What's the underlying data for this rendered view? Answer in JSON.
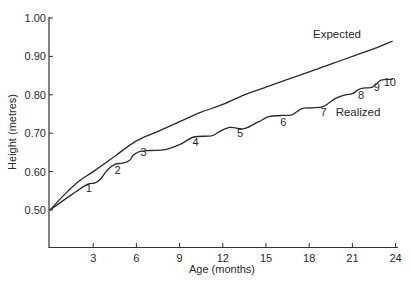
{
  "chart_data": {
    "type": "line",
    "title": "",
    "xlabel": "Age (months)",
    "ylabel": "Height (metres)",
    "xlim": [
      0,
      24
    ],
    "ylim": [
      0.42,
      1.0
    ],
    "grid": false,
    "legend": "inline labels",
    "x_ticks": [
      3,
      6,
      9,
      12,
      15,
      18,
      21,
      24
    ],
    "x_tick_labels": [
      "3",
      "6",
      "9",
      "12",
      "15",
      "18",
      "21",
      "24"
    ],
    "y_ticks": [
      0.5,
      0.6,
      0.7,
      0.8,
      0.9,
      1.0
    ],
    "y_tick_labels": [
      "0.50",
      "0.60",
      "0.70",
      "0.80",
      "0.90",
      "1.00"
    ],
    "series": [
      {
        "name": "Expected",
        "label": "Expected",
        "x": [
          0,
          1,
          2,
          3,
          4.5,
          6,
          7.5,
          9,
          10.5,
          12,
          13.5,
          15,
          16.5,
          18,
          19.5,
          21,
          22.5,
          23.8
        ],
        "values": [
          0.5,
          0.54,
          0.575,
          0.6,
          0.64,
          0.68,
          0.705,
          0.73,
          0.755,
          0.775,
          0.8,
          0.82,
          0.84,
          0.86,
          0.88,
          0.9,
          0.92,
          0.94
        ]
      },
      {
        "name": "Realized",
        "label": "Realized",
        "x": [
          0,
          1.5,
          2.6,
          3.1,
          3.5,
          4.0,
          4.5,
          5.0,
          5.5,
          5.8,
          6.2,
          7.0,
          8.0,
          9.0,
          10.0,
          11.2,
          11.8,
          12.5,
          13.2,
          13.6,
          14.5,
          15.2,
          16.0,
          16.8,
          17.5,
          18.2,
          19.0,
          19.8,
          20.5,
          21.0,
          21.5,
          21.9,
          22.4,
          23.0,
          23.8
        ],
        "values": [
          0.5,
          0.54,
          0.567,
          0.57,
          0.58,
          0.605,
          0.619,
          0.622,
          0.628,
          0.643,
          0.652,
          0.655,
          0.657,
          0.67,
          0.69,
          0.693,
          0.705,
          0.715,
          0.712,
          0.713,
          0.73,
          0.743,
          0.746,
          0.748,
          0.764,
          0.766,
          0.77,
          0.79,
          0.8,
          0.803,
          0.815,
          0.818,
          0.82,
          0.838,
          0.84
        ]
      }
    ],
    "annotations": [
      {
        "text": "1",
        "x": 2.7,
        "y": 0.547,
        "note": "dip markers along realized curve"
      },
      {
        "text": "2",
        "x": 4.7,
        "y": 0.594
      },
      {
        "text": "3",
        "x": 6.5,
        "y": 0.64
      },
      {
        "text": "4",
        "x": 10.1,
        "y": 0.667
      },
      {
        "text": "5",
        "x": 13.2,
        "y": 0.69
      },
      {
        "text": "6",
        "x": 16.2,
        "y": 0.719
      },
      {
        "text": "7",
        "x": 19.0,
        "y": 0.744
      },
      {
        "text": "8",
        "x": 21.6,
        "y": 0.79
      },
      {
        "text": "9",
        "x": 22.7,
        "y": 0.81
      },
      {
        "text": "10",
        "x": 23.6,
        "y": 0.823
      }
    ]
  }
}
